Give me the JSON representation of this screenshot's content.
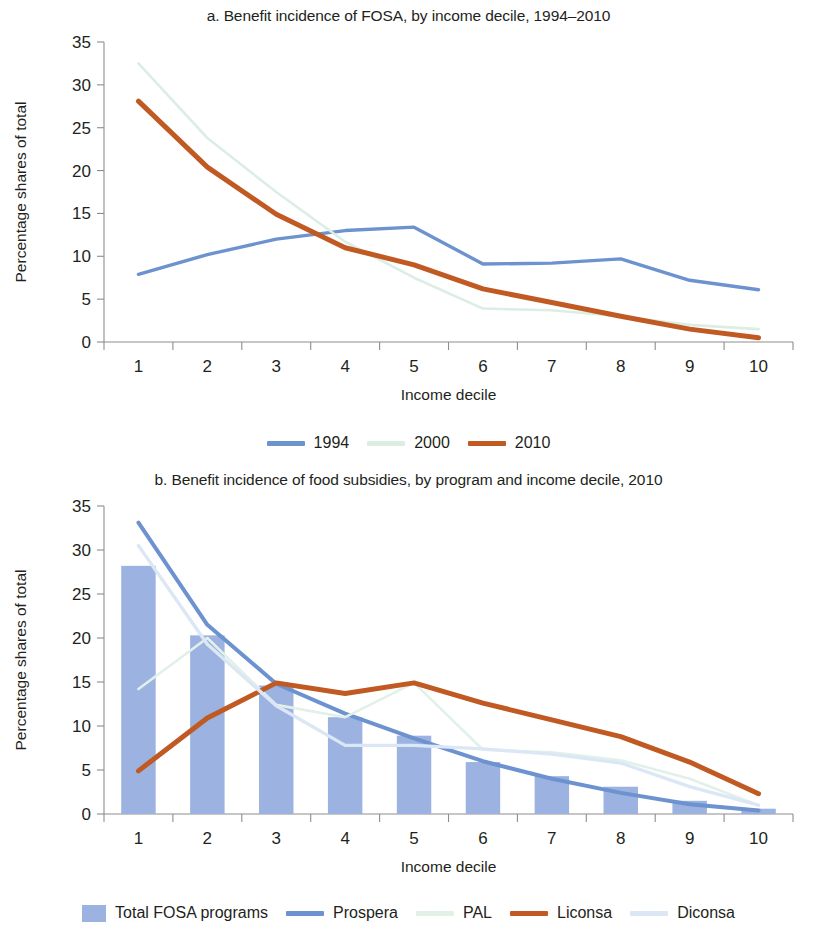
{
  "figure": {
    "y_axis_title": "Percentage shares of total",
    "x_axis_title": "Income decile"
  },
  "panel_a": {
    "title": "a. Benefit incidence of FOSA, by income decile, 1994–2010",
    "legend": [
      {
        "label": "1994",
        "color": "#6d92d0",
        "kind": "line"
      },
      {
        "label": "2000",
        "color": "#dceee4",
        "kind": "line"
      },
      {
        "label": "2010",
        "color": "#c05a22",
        "kind": "line"
      }
    ]
  },
  "panel_b": {
    "title": "b. Benefit incidence of food subsidies, by program and income decile, 2010",
    "legend": [
      {
        "label": "Total FOSA programs",
        "color": "#9cb2e0",
        "kind": "bar"
      },
      {
        "label": "Prospera",
        "color": "#6d92d0",
        "kind": "line"
      },
      {
        "label": "PAL",
        "color": "#e2f1e8",
        "kind": "line"
      },
      {
        "label": "Liconsa",
        "color": "#c05a22",
        "kind": "line"
      },
      {
        "label": "Diconsa",
        "color": "#dbe7f5",
        "kind": "line"
      }
    ]
  },
  "chart_data": [
    {
      "type": "line",
      "panel": "a",
      "title": "a. Benefit incidence of FOSA, by income decile, 1994–2010",
      "xlabel": "Income decile",
      "ylabel": "Percentage shares of total",
      "categories": [
        "1",
        "2",
        "3",
        "4",
        "5",
        "6",
        "7",
        "8",
        "9",
        "10"
      ],
      "ylim": [
        0,
        35
      ],
      "yticks": [
        0,
        5,
        10,
        15,
        20,
        25,
        30,
        35
      ],
      "grid": false,
      "legend_position": "bottom",
      "series": [
        {
          "name": "1994",
          "color": "#6d92d0",
          "width": 3.4,
          "values": [
            7.9,
            10.2,
            12.0,
            13.0,
            13.4,
            9.1,
            9.2,
            9.7,
            7.2,
            6.1
          ]
        },
        {
          "name": "2000",
          "color": "#dceee4",
          "width": 2.6,
          "values": [
            32.5,
            23.8,
            17.5,
            11.7,
            7.5,
            3.9,
            3.7,
            3.0,
            2.0,
            1.5
          ]
        },
        {
          "name": "2010",
          "color": "#c05a22",
          "width": 5.0,
          "values": [
            28.1,
            20.4,
            14.9,
            11.0,
            9.0,
            6.2,
            4.6,
            3.0,
            1.5,
            0.5
          ]
        }
      ]
    },
    {
      "type": "bar+line",
      "panel": "b",
      "title": "b. Benefit incidence of food subsidies, by program and income decile, 2010",
      "xlabel": "Income decile",
      "ylabel": "Percentage shares of total",
      "categories": [
        "1",
        "2",
        "3",
        "4",
        "5",
        "6",
        "7",
        "8",
        "9",
        "10"
      ],
      "ylim": [
        0,
        35
      ],
      "yticks": [
        0,
        5,
        10,
        15,
        20,
        25,
        30,
        35
      ],
      "grid": false,
      "legend_position": "bottom",
      "bars": {
        "name": "Total FOSA programs",
        "color": "#9cb2e0",
        "values": [
          28.2,
          20.3,
          14.6,
          11.0,
          8.9,
          5.9,
          4.3,
          3.1,
          1.5,
          0.6
        ]
      },
      "series": [
        {
          "name": "Prospera",
          "color": "#6d92d0",
          "width": 4.0,
          "values": [
            33.1,
            21.5,
            14.8,
            11.4,
            8.6,
            6.0,
            4.0,
            2.4,
            1.1,
            0.4
          ]
        },
        {
          "name": "PAL",
          "color": "#e2f1e8",
          "width": 2.6,
          "values": [
            14.2,
            20.0,
            12.4,
            11.0,
            14.9,
            7.3,
            7.0,
            6.1,
            4.0,
            1.0
          ]
        },
        {
          "name": "Liconsa",
          "color": "#c05a22",
          "width": 5.0,
          "values": [
            4.9,
            10.9,
            14.9,
            13.7,
            14.9,
            12.6,
            10.7,
            8.8,
            5.9,
            2.3
          ]
        },
        {
          "name": "Diconsa",
          "color": "#dbe7f5",
          "width": 3.4,
          "values": [
            30.5,
            19.3,
            12.3,
            7.8,
            7.8,
            7.4,
            6.8,
            5.8,
            3.1,
            1.0
          ]
        }
      ]
    }
  ]
}
